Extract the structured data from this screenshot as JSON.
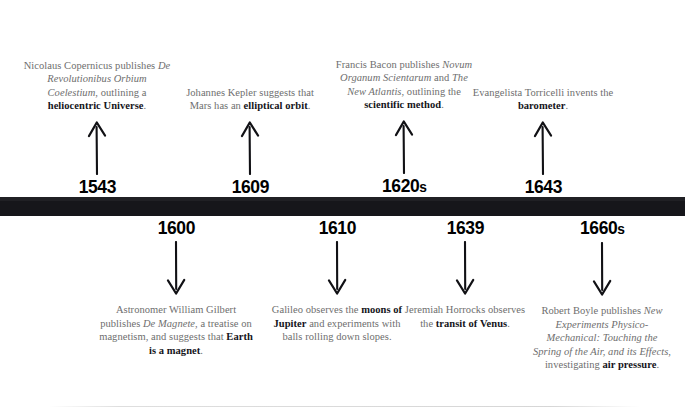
{
  "timeline": {
    "bar_color": "#16161a",
    "text_color": "#6e6e6e",
    "highlight_color": "#14141a",
    "events_above": [
      {
        "year": "1543",
        "year_suffix": "",
        "arrow": "arrow-up-icon",
        "text_html": "Nicolaus Copernicus publishes <i>De Revolutionibus Orbium Coelestium</i>, outlining a <b>heliocentric Universe</b>.",
        "plain_text": "Nicolaus Copernicus publishes De Revolutionibus Orbium Coelestium, outlining a heliocentric Universe.",
        "center_x": 97,
        "width": 150
      },
      {
        "year": "1609",
        "year_suffix": "",
        "arrow": "arrow-up-icon",
        "text_html": "Johannes Kepler suggests that Mars has an <b>elliptical orbit</b>.",
        "plain_text": "Johannes Kepler suggests that Mars has an elliptical orbit.",
        "center_x": 250,
        "width": 150
      },
      {
        "year": "1620",
        "year_suffix": "s",
        "arrow": "arrow-up-icon",
        "text_html": "Francis Bacon publishes <i>Novum Organum Scientarum</i> and <i>The New Atlantis</i>, outlining the <b>scientific method</b>.",
        "plain_text": "Francis Bacon publishes Novum Organum Scientarum and The New Atlantis, outlining the scientific method.",
        "center_x": 404,
        "width": 148
      },
      {
        "year": "1643",
        "year_suffix": "",
        "arrow": "arrow-up-icon",
        "text_html": "Evangelista Torricelli invents the <b>barometer</b>.",
        "plain_text": "Evangelista Torricelli invents the barometer.",
        "center_x": 543,
        "width": 150
      }
    ],
    "events_below": [
      {
        "year": "1600",
        "year_suffix": "",
        "arrow": "arrow-down-icon",
        "text_html": "Astronomer William Gilbert publishes <i>De Magnete</i>, a treatise on magnetism, and suggests that <b>Earth is a magnet</b>.",
        "plain_text": "Astronomer William Gilbert publishes De Magnete, a treatise on magnetism, and suggests that Earth is a magnet.",
        "center_x": 176,
        "width": 160
      },
      {
        "year": "1610",
        "year_suffix": "",
        "arrow": "arrow-down-icon",
        "text_html": "Galileo observes the <b>moons of Jupiter</b> and experiments with balls rolling down slopes.",
        "plain_text": "Galileo observes the moons of Jupiter and experiments with balls rolling down slopes.",
        "center_x": 337,
        "width": 142
      },
      {
        "year": "1639",
        "year_suffix": "",
        "arrow": "arrow-down-icon",
        "text_html": "Jeremiah Horrocks observes the <b>transit of Venus</b>.",
        "plain_text": "Jeremiah Horrocks observes the transit of Venus.",
        "center_x": 465,
        "width": 122
      },
      {
        "year": "1660",
        "year_suffix": "s",
        "arrow": "arrow-down-icon",
        "text_html": "Robert Boyle publishes <i>New Experiments Physico-Mechanical: Touching the Spring of the Air, and its Effects</i>, investigating <b>air pressure</b>.",
        "plain_text": "Robert Boyle publishes New Experiments Physico-Mechanical: Touching the Spring of the Air, and its Effects, investigating air pressure.",
        "center_x": 602,
        "width": 142
      }
    ]
  }
}
